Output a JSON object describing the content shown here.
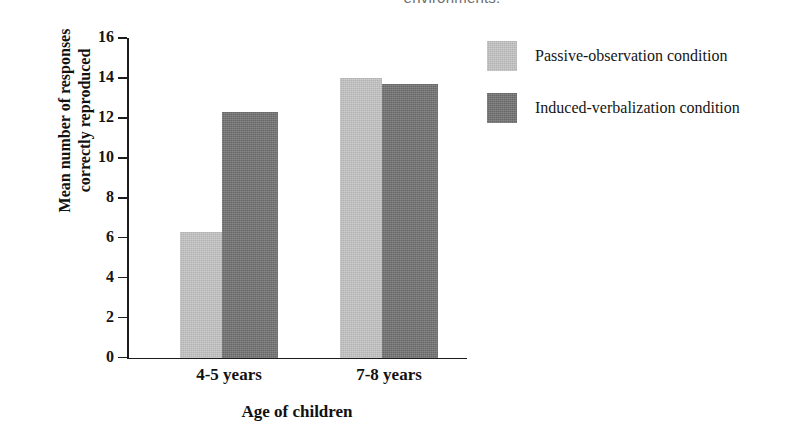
{
  "caption_fragment": "environments.",
  "chart_data": {
    "type": "bar",
    "title": "",
    "xlabel": "Age of children",
    "ylabel": "Mean number of responses\ncorrectly reproduced",
    "categories": [
      "4-5 years",
      "7-8 years"
    ],
    "series": [
      {
        "name": "Passive-observation condition",
        "color": "#c2c2c2",
        "values": [
          6.3,
          14.0
        ]
      },
      {
        "name": "Induced-verbalization condition",
        "color": "#6f6f6f",
        "values": [
          12.3,
          13.7
        ]
      }
    ],
    "ylim": [
      0,
      16
    ],
    "yticks": [
      0,
      2,
      4,
      6,
      8,
      10,
      12,
      14,
      16
    ],
    "ytick_labels": [
      "0",
      "2",
      "4",
      "6",
      "8",
      "10",
      "12",
      "14",
      "16"
    ],
    "grid": false,
    "legend_position": "right-top"
  }
}
